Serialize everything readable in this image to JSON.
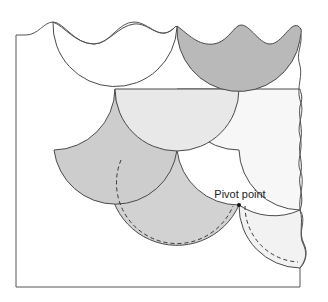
{
  "diagram": {
    "type": "quilting-template-scallop-layout",
    "annotation": {
      "label": "Pivot point",
      "marker": "dot"
    },
    "colors": {
      "outline": "#4a4a4a",
      "white_scale": "#ffffff",
      "dark_scale": "#b8b8b8",
      "medium_scale": "#cfcfcf",
      "light_scale": "#e6e6e6",
      "lightest_scale": "#f0f0f0",
      "background": "#ffffff"
    },
    "shapes": [
      {
        "name": "top-left-scale",
        "fill": "white"
      },
      {
        "name": "top-right-scale",
        "fill": "dark"
      },
      {
        "name": "middle-center-scale",
        "fill": "light"
      },
      {
        "name": "middle-left-scale",
        "fill": "medium"
      },
      {
        "name": "middle-right-scale",
        "fill": "lightest"
      },
      {
        "name": "bottom-center-scale",
        "fill": "medium",
        "seam": "dashed"
      },
      {
        "name": "bottom-right-scale",
        "fill": "lightest",
        "seam": "dashed"
      }
    ]
  }
}
